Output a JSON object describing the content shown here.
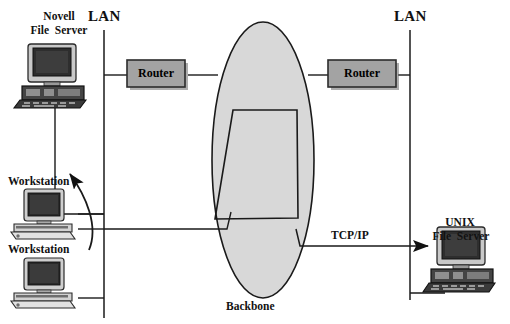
{
  "diagram": {
    "background_color": "#ffffff",
    "line_color": "#1a1a1a",
    "fill_gray": "#d6d6d6",
    "router_fill": "#a0a0a0",
    "labels": {
      "lan_left": "LAN",
      "lan_right": "LAN",
      "backbone": "Backbone",
      "tcpip": "TCP/IP",
      "novell_line1": "Novell",
      "novell_line2": "File  Server",
      "unix_line1": "UNIX",
      "unix_line2": "File  Server",
      "workstation_top": "Workstation",
      "workstation_bottom": "Workstation",
      "router_left": "Router",
      "router_right": "Router"
    },
    "nodes": [
      {
        "id": "novell-file-server",
        "label": "Novell File  Server",
        "type": "server",
        "x": 22,
        "y": 40
      },
      {
        "id": "workstation-top",
        "label": "Workstation",
        "type": "workstation",
        "x": 12,
        "y": 190
      },
      {
        "id": "workstation-bottom",
        "label": "Workstation",
        "type": "workstation",
        "x": 12,
        "y": 258
      },
      {
        "id": "router-left",
        "label": "Router",
        "type": "router",
        "x": 127,
        "y": 60
      },
      {
        "id": "router-right",
        "label": "Router",
        "type": "router",
        "x": 327,
        "y": 60
      },
      {
        "id": "backbone",
        "label": "Backbone",
        "type": "cloud",
        "x": 213,
        "y": 22
      },
      {
        "id": "unix-file-server",
        "label": "UNIX File  Server",
        "type": "server",
        "x": 430,
        "y": 248
      }
    ],
    "links": [
      {
        "from": "lan-left-bus",
        "to": "router-left",
        "style": "solid"
      },
      {
        "from": "router-left",
        "to": "backbone",
        "style": "solid"
      },
      {
        "from": "backbone",
        "to": "router-right",
        "style": "solid"
      },
      {
        "from": "router-right",
        "to": "lan-right-bus",
        "style": "solid"
      },
      {
        "from": "workstation-top",
        "to": "lan-left-bus",
        "style": "solid"
      },
      {
        "from": "workstation-bottom",
        "to": "lan-left-bus",
        "style": "solid"
      },
      {
        "from": "novell-file-server",
        "to": "lan-left-bus",
        "style": "solid"
      },
      {
        "from": "backbone",
        "to": "unix-file-server",
        "style": "arrow",
        "label": "TCP/IP"
      },
      {
        "from": "workstation-top",
        "to": "novell-file-server",
        "style": "curved-arrow"
      }
    ]
  }
}
